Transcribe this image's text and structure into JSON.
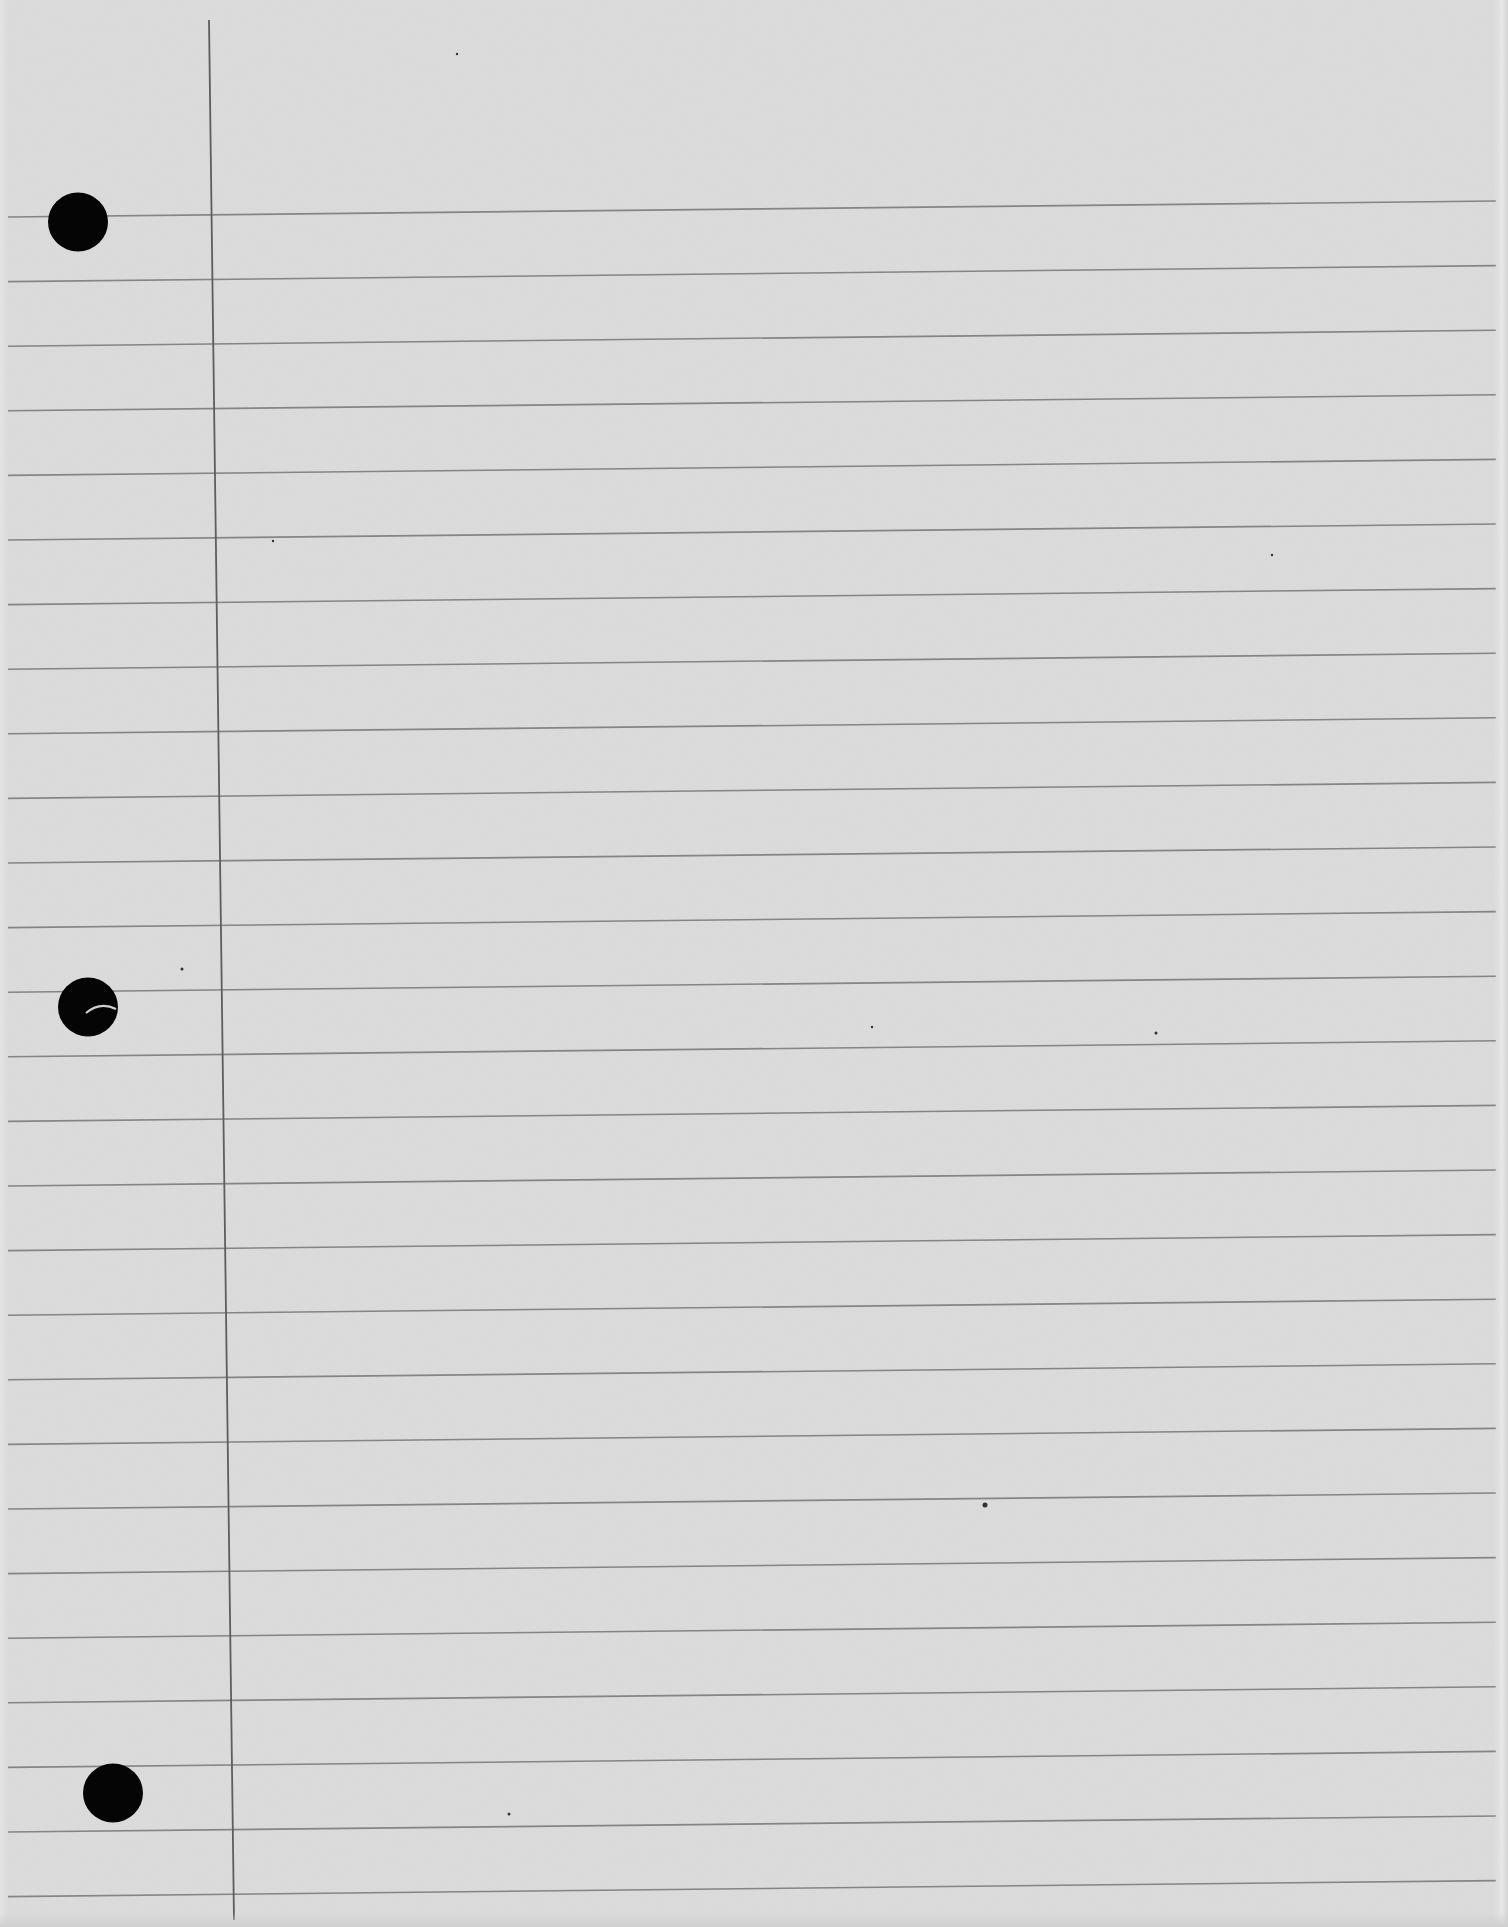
{
  "document": {
    "type": "lined-notebook-paper",
    "text_content": "",
    "width": 1508,
    "height": 1927
  },
  "colors": {
    "paper": "#dcdcdc",
    "rule_line": "#767676",
    "margin_line": "#5e5e5e",
    "punch_hole": "#050505",
    "hole_tear": "#d0d0d0"
  },
  "rules": {
    "count": 27,
    "first_y_left": 217,
    "first_y_right": 201,
    "spacing": 64.6,
    "x_start": 8,
    "x_end": 1496
  },
  "margin_line": {
    "x_top": 209,
    "y_top": 20,
    "x_bottom": 234,
    "y_bottom": 1920
  },
  "punch_holes": [
    {
      "name": "top",
      "cx": 78,
      "cy": 222,
      "r": 30
    },
    {
      "name": "middle",
      "cx": 88,
      "cy": 1007,
      "r": 30,
      "tear": true
    },
    {
      "name": "bottom",
      "cx": 113,
      "cy": 1793,
      "r": 30
    }
  ],
  "specks": [
    {
      "x": 182,
      "y": 969,
      "r": 1.5
    },
    {
      "x": 985,
      "y": 1505,
      "r": 2.5
    },
    {
      "x": 509,
      "y": 1814,
      "r": 1.5
    },
    {
      "x": 1156,
      "y": 1033,
      "r": 1.5
    },
    {
      "x": 872,
      "y": 1027,
      "r": 1.2
    },
    {
      "x": 457,
      "y": 54,
      "r": 1.2
    },
    {
      "x": 1272,
      "y": 555,
      "r": 1.2
    },
    {
      "x": 273,
      "y": 541,
      "r": 1.2
    }
  ]
}
